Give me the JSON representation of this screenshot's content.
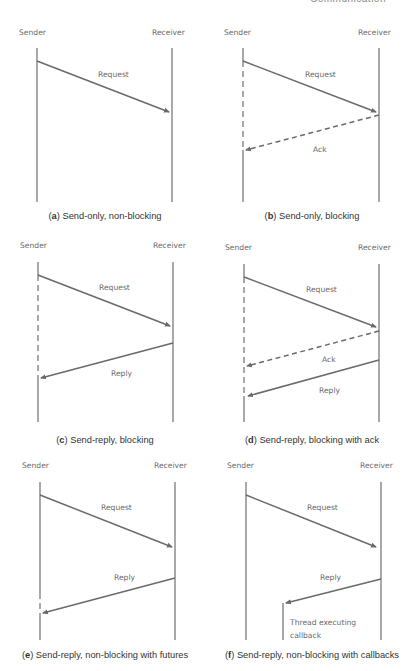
{
  "running_header": {
    "title": "Communication",
    "page": "11"
  },
  "labels": {
    "sender": "Sender",
    "receiver": "Receiver"
  },
  "panels": [
    {
      "id": "a",
      "letter": "a",
      "caption": "Send-only, non-blocking",
      "messages": [
        {
          "label": "Request",
          "style": "solid"
        }
      ]
    },
    {
      "id": "b",
      "letter": "b",
      "caption": "Send-only, blocking",
      "messages": [
        {
          "label": "Request",
          "style": "solid"
        },
        {
          "label": "Ack",
          "style": "dashed"
        }
      ]
    },
    {
      "id": "c",
      "letter": "c",
      "caption": "Send-reply, blocking",
      "messages": [
        {
          "label": "Request",
          "style": "solid"
        },
        {
          "label": "Reply",
          "style": "solid"
        }
      ]
    },
    {
      "id": "d",
      "letter": "d",
      "caption": "Send-reply, blocking with ack",
      "messages": [
        {
          "label": "Request",
          "style": "solid"
        },
        {
          "label": "Ack",
          "style": "dashed"
        },
        {
          "label": "Reply",
          "style": "solid"
        }
      ]
    },
    {
      "id": "e",
      "letter": "e",
      "caption": "Send-reply, non-blocking with futures",
      "messages": [
        {
          "label": "Request",
          "style": "solid"
        },
        {
          "label": "Reply",
          "style": "solid"
        }
      ]
    },
    {
      "id": "f",
      "letter": "f",
      "caption": "Send-reply, non-blocking with callbacks",
      "messages": [
        {
          "label": "Request",
          "style": "solid"
        },
        {
          "label": "Reply",
          "style": "solid"
        }
      ],
      "callback_note": [
        "Thread executing",
        "callback"
      ]
    }
  ],
  "colors": {
    "line": "#7a7a7a",
    "arrow": "#6a6a6a",
    "text": "#6a6a6a",
    "caption": "#333333"
  }
}
